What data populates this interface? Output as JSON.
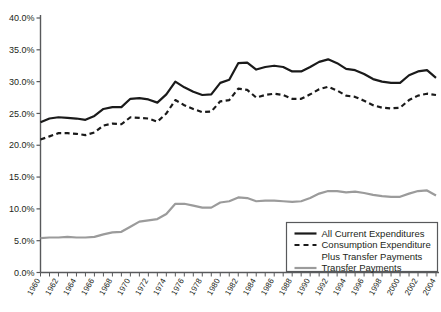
{
  "chart_data": {
    "type": "line",
    "title": "",
    "subtitle": "",
    "xlabel": "",
    "ylabel": "",
    "xlim": [
      1960,
      2004
    ],
    "ylim": [
      0,
      40
    ],
    "ytick_step": 5,
    "ytick_format": "percent_one_decimal",
    "xtick_step": 2,
    "grid": false,
    "legend_position": "bottom-right",
    "yticks": [
      "0.0%",
      "5.0%",
      "10.0%",
      "15.0%",
      "20.0%",
      "25.0%",
      "30.0%",
      "35.0%",
      "40.0%"
    ],
    "ytick_values": [
      0,
      5,
      10,
      15,
      20,
      25,
      30,
      35,
      40
    ],
    "xticks": [
      "1960",
      "1962",
      "1964",
      "1966",
      "1968",
      "1970",
      "1972",
      "1974",
      "1976",
      "1978",
      "1980",
      "1982",
      "1984",
      "1986",
      "1988",
      "1990",
      "1992",
      "1994",
      "1996",
      "1998",
      "2000",
      "2002",
      "2004"
    ],
    "x": [
      1960,
      1961,
      1962,
      1963,
      1964,
      1965,
      1966,
      1967,
      1968,
      1969,
      1970,
      1971,
      1972,
      1973,
      1974,
      1975,
      1976,
      1977,
      1978,
      1979,
      1980,
      1981,
      1982,
      1983,
      1984,
      1985,
      1986,
      1987,
      1988,
      1989,
      1990,
      1991,
      1992,
      1993,
      1994,
      1995,
      1996,
      1997,
      1998,
      1999,
      2000,
      2001,
      2002,
      2003,
      2004
    ],
    "series": [
      {
        "name": "All Current Expenditures",
        "style": "solid",
        "color": "#1a1a1a",
        "width": 2.2,
        "values": [
          23.6,
          24.2,
          24.4,
          24.3,
          24.2,
          24.0,
          24.6,
          25.7,
          26.0,
          26.0,
          27.3,
          27.4,
          27.2,
          26.7,
          28.0,
          30.0,
          29.1,
          28.4,
          27.9,
          28.0,
          29.8,
          30.3,
          32.9,
          33.0,
          31.9,
          32.3,
          32.5,
          32.3,
          31.6,
          31.6,
          32.3,
          33.1,
          33.5,
          32.9,
          32.0,
          31.8,
          31.2,
          30.4,
          30.0,
          29.8,
          29.8,
          31.0,
          31.6,
          31.8,
          30.6
        ]
      },
      {
        "name": "Consumption Expenditure Plus Transfer Payments",
        "style": "dashed",
        "color": "#1a1a1a",
        "width": 2.2,
        "values": [
          20.9,
          21.4,
          21.9,
          21.9,
          21.8,
          21.6,
          22.0,
          23.1,
          23.4,
          23.3,
          24.4,
          24.3,
          24.2,
          23.7,
          25.0,
          27.1,
          26.3,
          25.7,
          25.2,
          25.3,
          26.9,
          27.1,
          28.9,
          28.7,
          27.5,
          27.9,
          28.1,
          27.9,
          27.3,
          27.3,
          28.0,
          28.8,
          29.2,
          28.6,
          27.8,
          27.6,
          27.0,
          26.3,
          25.9,
          25.8,
          25.9,
          27.1,
          27.8,
          28.1,
          27.9
        ]
      },
      {
        "name": "Transfer Payments",
        "style": "solid",
        "color": "#9b9b9b",
        "width": 2.2,
        "values": [
          5.4,
          5.5,
          5.5,
          5.6,
          5.5,
          5.5,
          5.6,
          6.0,
          6.3,
          6.4,
          7.2,
          8.0,
          8.2,
          8.4,
          9.2,
          10.8,
          10.8,
          10.5,
          10.2,
          10.2,
          11.0,
          11.2,
          11.8,
          11.7,
          11.2,
          11.3,
          11.3,
          11.2,
          11.1,
          11.2,
          11.7,
          12.4,
          12.8,
          12.8,
          12.6,
          12.7,
          12.5,
          12.2,
          12.0,
          11.9,
          11.9,
          12.4,
          12.8,
          12.9,
          12.1
        ]
      }
    ],
    "legend_entries": [
      {
        "label": "All Current Expenditures",
        "style": "solid",
        "color": "#1a1a1a"
      },
      {
        "label": "Consumption Expenditure",
        "label2": "Plus Transfer Payments",
        "style": "dashed",
        "color": "#1a1a1a"
      },
      {
        "label": "Transfer Payments",
        "style": "solid",
        "color": "#9b9b9b"
      }
    ],
    "axis_color": "#58595b"
  }
}
